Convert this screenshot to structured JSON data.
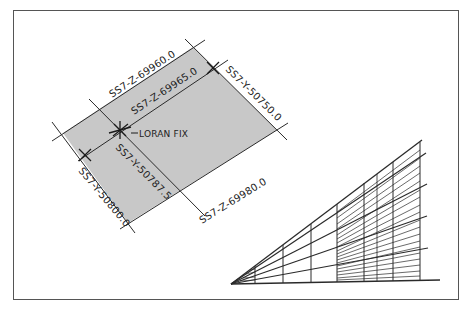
{
  "figure": {
    "type": "loran-chart-diagram",
    "colors": {
      "frame": "#555555",
      "fill": "#c8c8c8",
      "line": "#2a2a2a",
      "text": "#222222",
      "background": "#ffffff"
    }
  },
  "left_diagram": {
    "labels": {
      "z1": "SS7-Z-69960.0",
      "z2": "SS7-Z-69965.0",
      "z3": "SS7-Z-69980.0",
      "y1": "SS7-Y-50750.0",
      "y2": "SS7-Y-50787.5",
      "y3": "SS7-Y-50800.0",
      "fix": "LORAN FIX"
    }
  },
  "right_diagram": {
    "description": "perspective grid triangle with fanned lines and hatched interpolation region",
    "fan_lines": 5,
    "vertical_lines": 8
  }
}
